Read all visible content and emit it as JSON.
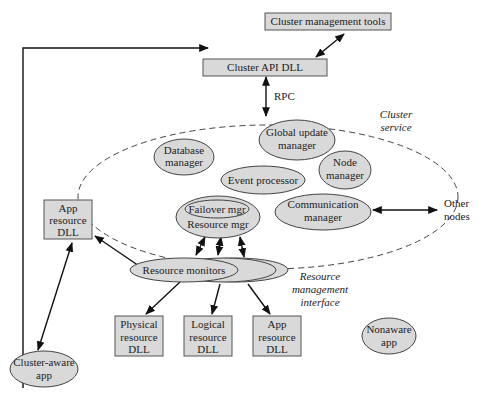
{
  "diagram": {
    "top": {
      "cluster_management_tools": "Cluster management tools",
      "cluster_api_dll": "Cluster API DLL",
      "rpc": "RPC"
    },
    "cluster_service": {
      "label_line1": "Cluster",
      "label_line2": "service",
      "database_manager": [
        "Database",
        "manager"
      ],
      "global_update_manager": [
        "Global update",
        "manager"
      ],
      "node_manager": [
        "Node",
        "manager"
      ],
      "event_processor": "Event processor",
      "failover_mgr": "Failover mgr",
      "resource_mgr": "Resource mgr",
      "communication_manager": [
        "Communication",
        "manager"
      ]
    },
    "other_nodes": [
      "Other",
      "nodes"
    ],
    "resource_monitors": "Resource monitors",
    "resource_management_interface": [
      "Resource",
      "management",
      "interface"
    ],
    "dlls": {
      "app_resource_left": [
        "App",
        "resource",
        "DLL"
      ],
      "physical": [
        "Physical",
        "resource",
        "DLL"
      ],
      "logical": [
        "Logical",
        "resource",
        "DLL"
      ],
      "app_resource_bottom": [
        "App",
        "resource",
        "DLL"
      ]
    },
    "cluster_aware_app": [
      "Cluster-aware",
      "app"
    ],
    "nonaware_app": [
      "Nonaware",
      "app"
    ]
  }
}
